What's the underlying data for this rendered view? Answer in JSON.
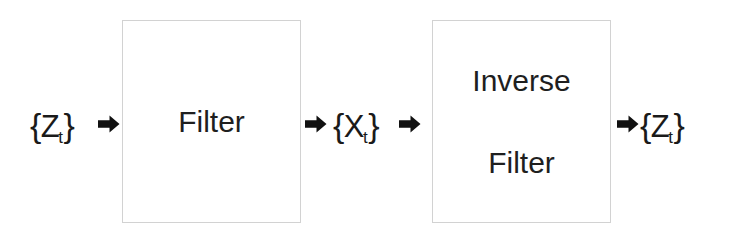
{
  "diagram": {
    "background_color": "#ffffff",
    "border_color": "#d2d2d2",
    "text_color": "#1a1a1a",
    "nodes": [
      {
        "id": "input-signal",
        "kind": "label",
        "brace_open": "{",
        "base": "Z",
        "subscript": "t",
        "brace_close": "}",
        "text": "{Zt}"
      },
      {
        "id": "filter-block",
        "kind": "block",
        "label": "Filter"
      },
      {
        "id": "intermediate-signal",
        "kind": "label",
        "brace_open": "{",
        "base": "X",
        "subscript": "t",
        "brace_close": "}",
        "text": "{Xt}"
      },
      {
        "id": "inverse-filter-block",
        "kind": "block",
        "label_line_1": "Inverse",
        "label_line_2": "Filter"
      },
      {
        "id": "output-signal",
        "kind": "label",
        "brace_open": "{",
        "base": "Z",
        "subscript": "t",
        "brace_close": "}",
        "text": "{Zt}"
      }
    ],
    "arrows": [
      {
        "id": "arrow-input-to-filter",
        "direction": "right",
        "from": "input-signal",
        "to": "filter-block"
      },
      {
        "id": "arrow-filter-to-intermediate",
        "direction": "right",
        "from": "filter-block",
        "to": "intermediate-signal"
      },
      {
        "id": "arrow-intermediate-to-inverse-filter",
        "direction": "right",
        "from": "intermediate-signal",
        "to": "inverse-filter-block"
      },
      {
        "id": "arrow-inverse-filter-to-output",
        "direction": "right",
        "from": "inverse-filter-block",
        "to": "output-signal"
      }
    ]
  }
}
